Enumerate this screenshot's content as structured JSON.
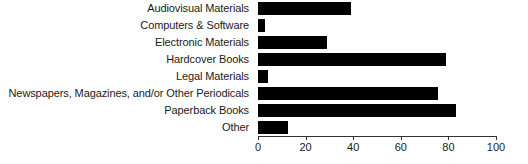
{
  "chart_data": {
    "type": "bar",
    "orientation": "horizontal",
    "title": "",
    "xlabel": "",
    "ylabel": "",
    "xlim": [
      0,
      100
    ],
    "grid": false,
    "legend": false,
    "categories": [
      "Audiovisual Materials",
      "Computers & Software",
      "Electronic Materials",
      "Hardcover Books",
      "Legal Materials",
      "Newspapers, Magazines, and/or Other Periodicals",
      "Paperback Books",
      "Other"
    ],
    "values": [
      39,
      3,
      29,
      79,
      4,
      75.5,
      83,
      12.5
    ],
    "xticks": [
      0,
      20,
      40,
      60,
      80,
      100
    ],
    "xtick_labels": [
      "0",
      "20",
      "40",
      "60",
      "80",
      "100"
    ],
    "bar_color": "#000000",
    "axis_color": "#333333",
    "text_color": "#1b1b1b",
    "background_color": "#ffffff"
  }
}
